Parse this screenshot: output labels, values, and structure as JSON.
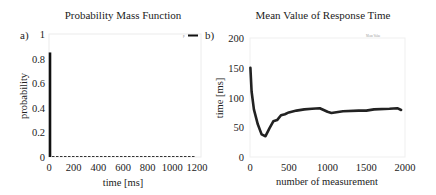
{
  "chart_data": [
    {
      "panel_label": "a)",
      "type": "bar",
      "title": "Probability Mass Function",
      "xlabel": "time [ms]",
      "ylabel": "probability",
      "xlim": [
        0,
        1200
      ],
      "ylim": [
        0,
        1
      ],
      "xticks": [
        "0",
        "200",
        "400",
        "600",
        "800",
        "1000",
        "1200"
      ],
      "yticks": [
        "0",
        "0.2",
        "0.4",
        "0.6",
        "0.8",
        "1"
      ],
      "grid": false,
      "legend_position": "top-right",
      "series": [
        {
          "name": "p",
          "x": [
            0,
            100,
            200,
            300,
            400,
            500,
            600,
            700,
            800,
            900,
            1000,
            1100
          ],
          "values": [
            0.85,
            0.003,
            0.003,
            0.003,
            0.003,
            0.003,
            0.003,
            0.003,
            0.003,
            0.003,
            0.003,
            0.003
          ]
        }
      ]
    },
    {
      "panel_label": "b)",
      "type": "line",
      "title": "Mean Value of Response Time",
      "xlabel": "number of measurement",
      "ylabel": "time [ms]",
      "xlim": [
        0,
        2000
      ],
      "ylim": [
        0,
        200
      ],
      "xticks": [
        "0",
        "500",
        "1000",
        "1500",
        "2000"
      ],
      "yticks": [
        "0",
        "50",
        "100",
        "150",
        "200"
      ],
      "grid": false,
      "legend_position": "top-right",
      "series": [
        {
          "name": "Mean Value",
          "x": [
            5,
            20,
            50,
            100,
            150,
            200,
            250,
            300,
            350,
            400,
            450,
            500,
            600,
            700,
            800,
            900,
            1000,
            1050,
            1200,
            1400,
            1500,
            1600,
            1800,
            1900,
            1950
          ],
          "values": [
            150,
            110,
            80,
            55,
            38,
            35,
            48,
            60,
            62,
            70,
            72,
            75,
            78,
            80,
            81,
            82,
            76,
            74,
            77,
            78,
            78,
            80,
            81,
            82,
            79
          ]
        }
      ]
    }
  ]
}
